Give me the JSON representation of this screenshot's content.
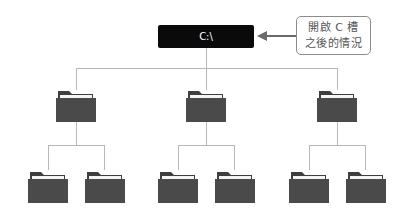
{
  "diagram": {
    "root": {
      "label": "C:\\"
    },
    "callout": {
      "line1": "開啟 C 槽",
      "line2": "之後的情況"
    },
    "colors": {
      "root_bg": "#0a0a0a",
      "folder": "#4a4a4a",
      "connector": "#b8b8b8",
      "arrow": "#6a6a6a"
    },
    "level1": [
      {
        "icon": "folder-icon",
        "children": [
          "folder-icon",
          "folder-icon"
        ]
      },
      {
        "icon": "folder-icon",
        "children": [
          "folder-icon",
          "folder-icon"
        ]
      },
      {
        "icon": "folder-icon",
        "children": [
          "folder-icon",
          "folder-icon"
        ]
      }
    ]
  }
}
